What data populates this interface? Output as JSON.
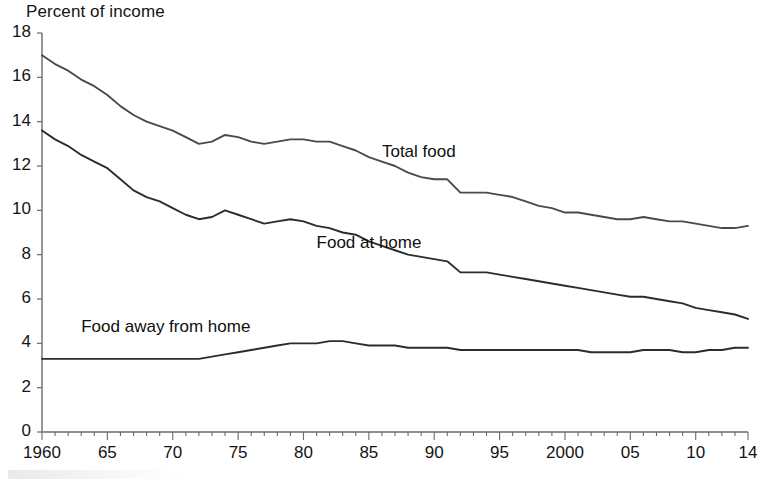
{
  "chart_data": {
    "type": "line",
    "title": "",
    "ylabel": "Percent of income",
    "xlabel": "",
    "ylim": [
      0,
      18
    ],
    "ytick_step": 2,
    "xlim": [
      1960,
      2014
    ],
    "grid": false,
    "legend_position": "inline-annotation",
    "y_tick_labels": [
      "0",
      "2",
      "4",
      "6",
      "8",
      "10",
      "12",
      "14",
      "16",
      "18"
    ],
    "x_tick_labels": [
      "1960",
      "65",
      "70",
      "75",
      "80",
      "85",
      "90",
      "95",
      "2000",
      "05",
      "10",
      "14"
    ],
    "x_tick_years": [
      1960,
      1965,
      1970,
      1975,
      1980,
      1985,
      1990,
      1995,
      2000,
      2005,
      2010,
      2014
    ],
    "x": [
      1960,
      1961,
      1962,
      1963,
      1964,
      1965,
      1966,
      1967,
      1968,
      1969,
      1970,
      1971,
      1972,
      1973,
      1974,
      1975,
      1976,
      1977,
      1978,
      1979,
      1980,
      1981,
      1982,
      1983,
      1984,
      1985,
      1986,
      1987,
      1988,
      1989,
      1990,
      1991,
      1992,
      1993,
      1994,
      1995,
      1996,
      1997,
      1998,
      1999,
      2000,
      2001,
      2002,
      2003,
      2004,
      2005,
      2006,
      2007,
      2008,
      2009,
      2010,
      2011,
      2012,
      2013,
      2014
    ],
    "series": [
      {
        "name": "Total food",
        "color": "#4a4a4a",
        "label_x": 1986,
        "label_y": 12.6,
        "values": [
          17.0,
          16.6,
          16.3,
          15.9,
          15.6,
          15.2,
          14.7,
          14.3,
          14.0,
          13.8,
          13.6,
          13.3,
          13.0,
          13.1,
          13.4,
          13.3,
          13.1,
          13.0,
          13.1,
          13.2,
          13.2,
          13.1,
          13.1,
          12.9,
          12.7,
          12.4,
          12.2,
          12.0,
          11.7,
          11.5,
          11.4,
          11.4,
          10.8,
          10.8,
          10.8,
          10.7,
          10.6,
          10.4,
          10.2,
          10.1,
          9.9,
          9.9,
          9.8,
          9.7,
          9.6,
          9.6,
          9.7,
          9.6,
          9.5,
          9.5,
          9.4,
          9.3,
          9.2,
          9.2,
          9.3
        ]
      },
      {
        "name": "Food at home",
        "color": "#2c2c2c",
        "label_x": 1981,
        "label_y": 8.5,
        "values": [
          13.6,
          13.2,
          12.9,
          12.5,
          12.2,
          11.9,
          11.4,
          10.9,
          10.6,
          10.4,
          10.1,
          9.8,
          9.6,
          9.7,
          10.0,
          9.8,
          9.6,
          9.4,
          9.5,
          9.6,
          9.5,
          9.3,
          9.2,
          9.0,
          8.9,
          8.6,
          8.4,
          8.2,
          8.0,
          7.9,
          7.8,
          7.7,
          7.2,
          7.2,
          7.2,
          7.1,
          7.0,
          6.9,
          6.8,
          6.7,
          6.6,
          6.5,
          6.4,
          6.3,
          6.2,
          6.1,
          6.1,
          6.0,
          5.9,
          5.8,
          5.6,
          5.5,
          5.4,
          5.3,
          5.1
        ]
      },
      {
        "name": "Food away from home",
        "color": "#2c2c2c",
        "label_x": 1963,
        "label_y": 4.7,
        "values": [
          3.3,
          3.3,
          3.3,
          3.3,
          3.3,
          3.3,
          3.3,
          3.3,
          3.3,
          3.3,
          3.3,
          3.3,
          3.3,
          3.4,
          3.5,
          3.6,
          3.7,
          3.8,
          3.9,
          4.0,
          4.0,
          4.0,
          4.1,
          4.1,
          4.0,
          3.9,
          3.9,
          3.9,
          3.8,
          3.8,
          3.8,
          3.8,
          3.7,
          3.7,
          3.7,
          3.7,
          3.7,
          3.7,
          3.7,
          3.7,
          3.7,
          3.7,
          3.6,
          3.6,
          3.6,
          3.6,
          3.7,
          3.7,
          3.7,
          3.6,
          3.6,
          3.7,
          3.7,
          3.8,
          3.8
        ]
      }
    ]
  }
}
